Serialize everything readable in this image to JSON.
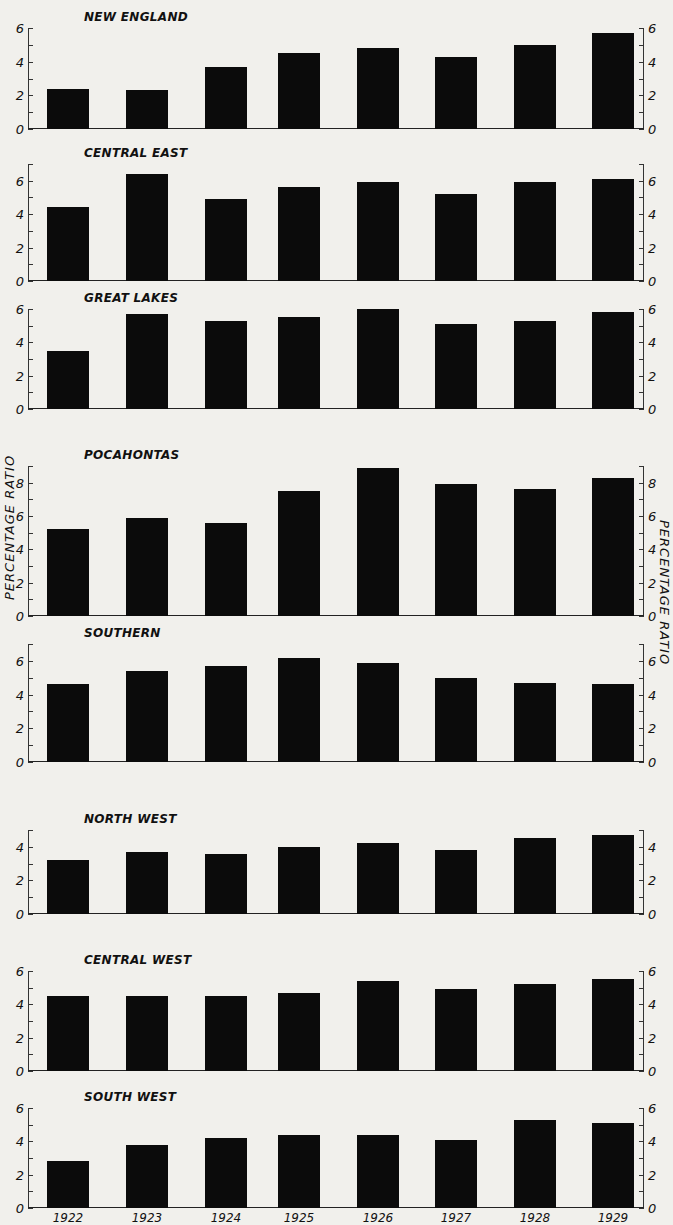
{
  "chart_data": {
    "type": "bar",
    "title": "",
    "xlabel": "",
    "ylabel": "PERCENTAGE RATIO",
    "ylabel_right": "PERCENTAGE RATIO",
    "categories": [
      "1922",
      "1923",
      "1924",
      "1925",
      "1926",
      "1927",
      "1928",
      "1929"
    ],
    "grid": false,
    "legend": null,
    "panels": [
      {
        "name": "NEW ENGLAND",
        "ylim": [
          0,
          6
        ],
        "ticks": [
          0,
          2,
          4,
          6
        ],
        "values": [
          2.4,
          2.3,
          3.7,
          4.5,
          4.8,
          4.3,
          5.0,
          5.7
        ]
      },
      {
        "name": "CENTRAL EAST",
        "ylim": [
          0,
          7
        ],
        "ticks": [
          0,
          2,
          4,
          6
        ],
        "values": [
          4.4,
          6.4,
          4.9,
          5.6,
          5.9,
          5.2,
          5.9,
          6.1
        ]
      },
      {
        "name": "GREAT LAKES",
        "ylim": [
          0,
          6
        ],
        "ticks": [
          0,
          2,
          4,
          6
        ],
        "values": [
          3.5,
          5.7,
          5.3,
          5.5,
          6.0,
          5.1,
          5.3,
          5.8
        ]
      },
      {
        "name": "POCAHONTAS",
        "ylim": [
          0,
          9
        ],
        "ticks": [
          0,
          2,
          4,
          6,
          8
        ],
        "values": [
          5.2,
          5.9,
          5.6,
          7.5,
          8.9,
          7.9,
          7.6,
          8.3
        ]
      },
      {
        "name": "SOUTHERN",
        "ylim": [
          0,
          7
        ],
        "ticks": [
          0,
          2,
          4,
          6
        ],
        "values": [
          4.6,
          5.4,
          5.7,
          6.2,
          5.9,
          5.0,
          4.7,
          4.6
        ]
      },
      {
        "name": "NORTH WEST",
        "ylim": [
          0,
          5
        ],
        "ticks": [
          0,
          2,
          4
        ],
        "values": [
          3.2,
          3.7,
          3.6,
          4.0,
          4.2,
          3.8,
          4.5,
          4.7
        ]
      },
      {
        "name": "CENTRAL WEST",
        "ylim": [
          0,
          6
        ],
        "ticks": [
          0,
          2,
          4,
          6
        ],
        "values": [
          4.5,
          4.5,
          4.5,
          4.7,
          5.4,
          4.9,
          5.2,
          5.5
        ]
      },
      {
        "name": "SOUTH WEST",
        "ylim": [
          0,
          6
        ],
        "ticks": [
          0,
          2,
          4,
          6
        ],
        "values": [
          2.8,
          3.8,
          4.2,
          4.4,
          4.4,
          4.1,
          5.3,
          5.1
        ]
      }
    ]
  },
  "layout": {
    "panel_tops": [
      14,
      150,
      295,
      452,
      630,
      816,
      957,
      1094
    ],
    "panel_heights": [
      101,
      117,
      100,
      150,
      118,
      84,
      100,
      100
    ],
    "bar_lefts": [
      19,
      98,
      177,
      250,
      329,
      407,
      486,
      564
    ],
    "bar_color": "#0b0b0b",
    "background": "#f1f0ec"
  }
}
